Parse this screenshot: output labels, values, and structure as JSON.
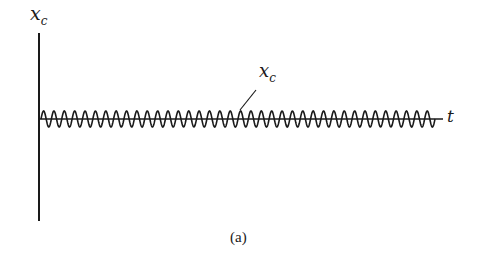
{
  "figure": {
    "y_axis_label": "x",
    "y_axis_subscript": "c",
    "curve_label": "x",
    "curve_subscript": "c",
    "x_axis_label": "t",
    "caption": "(a)"
  },
  "style": {
    "ink": "#1a1a1a"
  },
  "chart_data": {
    "type": "line",
    "title": "",
    "xlabel": "t",
    "ylabel": "x_c",
    "series": [
      {
        "name": "x_c",
        "description": "sustained constant-amplitude sinusoidal oscillation about zero",
        "cycles": 38,
        "amplitude_rel": 1.0
      }
    ],
    "annotations": [
      "x_c",
      "(a)"
    ]
  }
}
